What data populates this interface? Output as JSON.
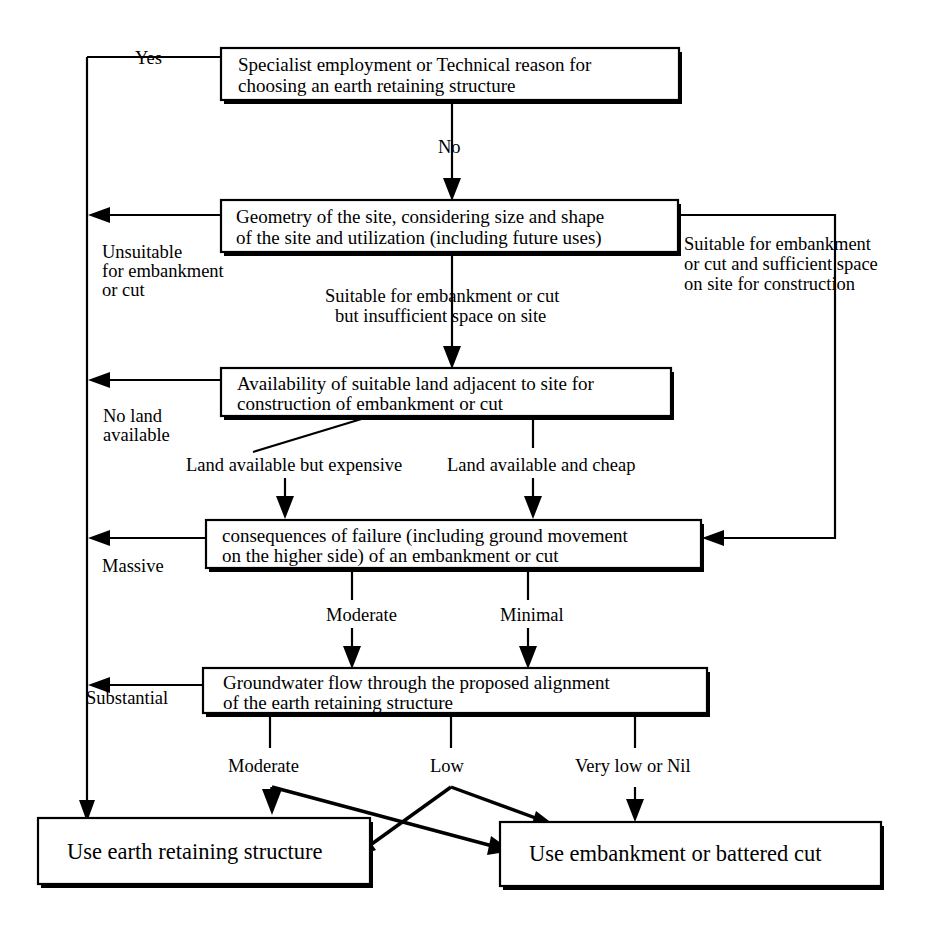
{
  "diagram": {
    "background_color": "#ffffff",
    "line_color": "#000000",
    "nodes": [
      {
        "id": "specialist",
        "lines": [
          "Specialist employment or Technical reason for",
          "choosing an earth retaining structure"
        ]
      },
      {
        "id": "geometry",
        "lines": [
          "Geometry of the site, considering size and shape",
          "of the site and utilization (including future uses)"
        ]
      },
      {
        "id": "availability",
        "lines": [
          "Availability of suitable land adjacent to site for",
          "construction of embankment or cut"
        ]
      },
      {
        "id": "consequences",
        "lines": [
          "consequences of failure (including ground movement",
          "on the higher side) of an embankment or cut"
        ]
      },
      {
        "id": "groundwater",
        "lines": [
          "Groundwater flow through the proposed alignment",
          "of the earth retaining structure"
        ]
      },
      {
        "id": "outcome_retaining",
        "lines": [
          "Use earth retaining structure"
        ]
      },
      {
        "id": "outcome_embankment",
        "lines": [
          "Use embankment or battered cut"
        ]
      }
    ],
    "edge_labels": {
      "yes": "Yes",
      "no": "No",
      "unsuitable": [
        "Unsuitable",
        "for embankment",
        "or cut"
      ],
      "suitable_insufficient": [
        "Suitable for embankment or cut",
        "but insufficient space on site"
      ],
      "suitable_sufficient": [
        "Suitable for embankment",
        "or cut and sufficient space",
        "on site for construction"
      ],
      "no_land": [
        "No land",
        "available"
      ],
      "land_expensive": "Land available but expensive",
      "land_cheap": "Land available and cheap",
      "massive": "Massive",
      "moderate_failure": "Moderate",
      "minimal": "Minimal",
      "substantial": "Substantial",
      "moderate_water": "Moderate",
      "low": "Low",
      "very_low_nil": "Very low or Nil"
    }
  }
}
